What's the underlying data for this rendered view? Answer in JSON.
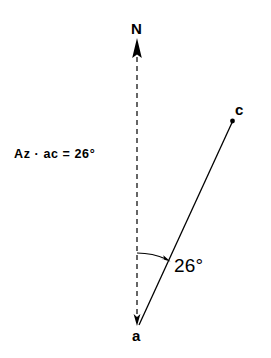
{
  "figure": {
    "kind": "azimuth-diagram",
    "width": 271,
    "height": 358,
    "background_color": "#ffffff",
    "stroke_color": "#000000",
    "labels": {
      "north": "N",
      "point_a": "a",
      "point_c": "c",
      "angle_value": "26°",
      "azimuth_expression": "Az · ac  =  26°"
    },
    "geometry": {
      "origin_point_a": {
        "x": 139,
        "y": 325
      },
      "endpoint_point_c": {
        "x": 232,
        "y": 121
      },
      "north_line": {
        "x": 137,
        "top_y": 40,
        "bottom_y": 325,
        "style": "dashed"
      },
      "north_arrow_tip": {
        "x": 137,
        "y": 39
      },
      "angle_degrees": 26,
      "angle_arc_radius": 72
    }
  }
}
